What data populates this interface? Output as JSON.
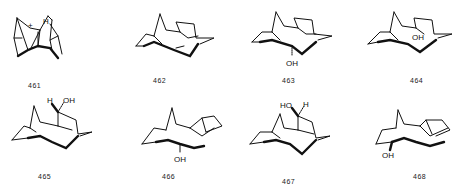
{
  "figure": {
    "compounds": [
      {
        "id": "461",
        "label": "461",
        "substituents": [
          "+",
          "H"
        ],
        "description": "bridged polycyclic carbocation"
      },
      {
        "id": "462",
        "label": "462",
        "substituents": [],
        "description": "bridged polycyclic alkene"
      },
      {
        "id": "463",
        "label": "463",
        "substituents": [
          "OH"
        ],
        "description": "polycyclic alcohol, hashed OH"
      },
      {
        "id": "464",
        "label": "464",
        "substituents": [
          "OH"
        ],
        "description": "polycyclic alcohol"
      },
      {
        "id": "465",
        "label": "465",
        "substituents": [
          "H",
          "OH"
        ],
        "description": "polycyclic alcohol, H/OH on bridge"
      },
      {
        "id": "466",
        "label": "466",
        "substituents": [
          "OH"
        ],
        "description": "polycyclic tertiary alcohol"
      },
      {
        "id": "467",
        "label": "467",
        "substituents": [
          "HO",
          "H"
        ],
        "description": "polycyclic alcohol, HO/H on bridge"
      },
      {
        "id": "468",
        "label": "468",
        "substituents": [
          "OH"
        ],
        "description": "polycyclic bridgehead alcohol"
      }
    ],
    "atoms": {
      "plus": "+",
      "H": "H",
      "OH": "OH",
      "HO": "HO"
    }
  }
}
